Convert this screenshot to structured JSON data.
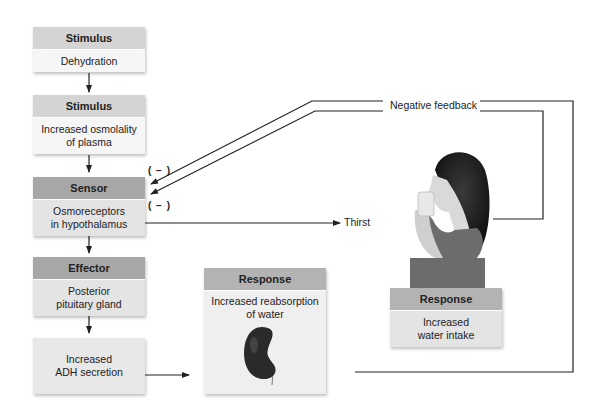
{
  "diagram": {
    "boxes": {
      "stimulus1": {
        "header": "Stimulus",
        "body": "Dehydration"
      },
      "stimulus2": {
        "header": "Stimulus",
        "body_line1": "Increased osmolality",
        "body_line2": "of plasma"
      },
      "sensor": {
        "header": "Sensor",
        "body_line1": "Osmoreceptors",
        "body_line2": "in hypothalamus"
      },
      "effector": {
        "header": "Effector",
        "body_line1": "Posterior",
        "body_line2": "pituitary gland"
      },
      "adh": {
        "body_line1": "Increased",
        "body_line2": "ADH secretion"
      },
      "response_kidney": {
        "header": "Response",
        "body_line1": "Increased reabsorption",
        "body_line2": "of water",
        "icon": "kidney-icon"
      },
      "response_water": {
        "header": "Response",
        "body_line1": "Increased",
        "body_line2": "water intake",
        "image": "woman-drinking-water"
      }
    },
    "labels": {
      "negative_feedback": "Negative feedback",
      "thirst": "Thirst",
      "inhibit1": "( − )",
      "inhibit2": "( − )"
    },
    "colors": {
      "header_light": "#d4d4d4",
      "header_dark": "#a7a7a7",
      "body_light": "#f6f6f6",
      "line": "#222222"
    }
  }
}
